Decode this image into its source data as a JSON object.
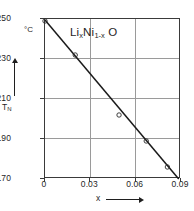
{
  "figure": {
    "annotation": "Li",
    "annotation_sub1": "x",
    "annotation_mid": "Ni",
    "annotation_sub2": "1-x",
    "annotation_end": "O",
    "y_unit": "°C",
    "y_axis_title": "T",
    "y_axis_title_sub": "N",
    "x_axis_title": "x",
    "colors": {
      "line": "#1a1a1a",
      "frame": "#3a3a3a",
      "grid": "#9a9a9a",
      "background": "#ffffff"
    }
  },
  "chart_data": {
    "type": "line",
    "xlabel": "x",
    "ylabel": "T_N",
    "y_unit": "°C",
    "xlim": [
      0,
      0.09
    ],
    "ylim": [
      170,
      250
    ],
    "xticks": [
      0,
      0.03,
      0.06,
      0.09
    ],
    "xticklabels": [
      "0",
      "0.03",
      "0.06",
      "0.09"
    ],
    "yticks": [
      170,
      190,
      210,
      230,
      250
    ],
    "yticklabels": [
      "170",
      "190",
      "210",
      "230",
      "250"
    ],
    "grid": "both",
    "legend": "none",
    "series": [
      {
        "name": "T_N vs x",
        "style": "line-with-markers",
        "marker": "open-circle",
        "x": [
          0.0,
          0.02,
          0.049,
          0.067,
          0.081
        ],
        "y": [
          249,
          232,
          202,
          189,
          176
        ]
      },
      {
        "name": "linear fit",
        "style": "solid-line",
        "x": [
          0.0,
          0.0885
        ],
        "y": [
          249.5,
          170
        ]
      }
    ]
  }
}
